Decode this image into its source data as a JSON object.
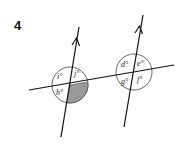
{
  "question_number": "4",
  "diagram": {
    "type": "parallel lines cut by a transversal",
    "parallel_line_count": 2,
    "parallel_marker": "single arrow on each line",
    "left_intersection": {
      "labels": {
        "top_left": "i°",
        "top_right": "j°",
        "bottom_left": "h°"
      },
      "shaded_angle": "bottom_right"
    },
    "right_intersection": {
      "labels": {
        "top_left": "d°",
        "top_right": "e°",
        "bottom_left": "g°",
        "bottom_right": "f°"
      }
    },
    "colors": {
      "line": "#111111",
      "shade": "#9a9a9a",
      "circle": "#444444"
    }
  }
}
